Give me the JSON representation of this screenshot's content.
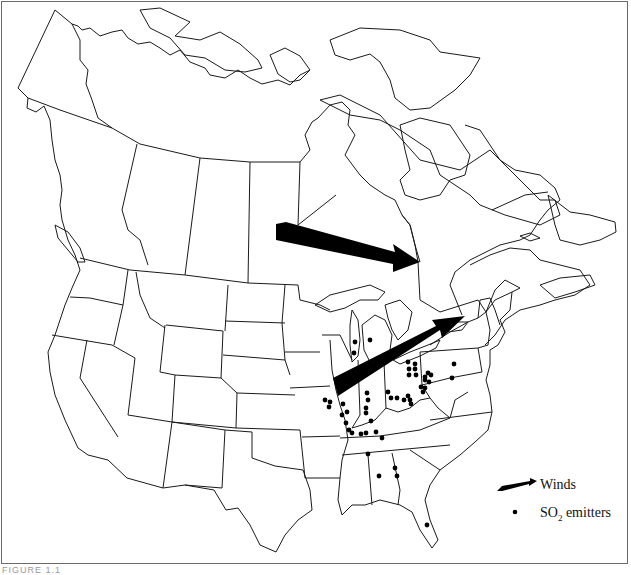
{
  "map": {
    "title": "",
    "region": "North America (Canada, United States)",
    "colors": {
      "outline": "#1a1a1a",
      "arrow_fill": "#000000",
      "dot_fill": "#000000",
      "background": "#ffffff"
    },
    "wind_arrows": [
      {
        "name": "arrow-central-canada",
        "from": [
          275,
          232
        ],
        "to": [
          418,
          262
        ]
      },
      {
        "name": "arrow-ohio-valley",
        "from": [
          335,
          385
        ],
        "to": [
          462,
          316
        ]
      }
    ],
    "so2_emitters": [
      [
        355,
        342
      ],
      [
        370,
        340
      ],
      [
        354,
        353
      ],
      [
        408,
        362
      ],
      [
        415,
        364
      ],
      [
        409,
        369
      ],
      [
        415,
        369
      ],
      [
        409,
        375
      ],
      [
        416,
        375
      ],
      [
        425,
        377
      ],
      [
        428,
        373
      ],
      [
        431,
        375
      ],
      [
        425,
        380
      ],
      [
        429,
        382
      ],
      [
        421,
        387
      ],
      [
        425,
        388
      ],
      [
        423,
        392
      ],
      [
        454,
        364
      ],
      [
        452,
        378
      ],
      [
        367,
        393
      ],
      [
        368,
        400
      ],
      [
        366,
        408
      ],
      [
        366,
        413
      ],
      [
        388,
        392
      ],
      [
        391,
        398
      ],
      [
        397,
        398
      ],
      [
        404,
        400
      ],
      [
        408,
        396
      ],
      [
        410,
        400
      ],
      [
        411,
        404
      ],
      [
        325,
        400
      ],
      [
        330,
        402
      ],
      [
        329,
        407
      ],
      [
        343,
        404
      ],
      [
        347,
        412
      ],
      [
        342,
        415
      ],
      [
        346,
        423
      ],
      [
        371,
        421
      ],
      [
        349,
        430
      ],
      [
        352,
        433
      ],
      [
        361,
        434
      ],
      [
        366,
        433
      ],
      [
        376,
        432
      ],
      [
        382,
        438
      ],
      [
        368,
        454
      ],
      [
        379,
        476
      ],
      [
        395,
        468
      ],
      [
        397,
        476
      ],
      [
        427,
        525
      ]
    ]
  },
  "legend": {
    "winds_label": "Winds",
    "emitters_label_prefix": "SO",
    "emitters_label_sub": "2",
    "emitters_label_suffix": " emitters"
  },
  "caption": {
    "text": "FIGURE 1.1"
  }
}
